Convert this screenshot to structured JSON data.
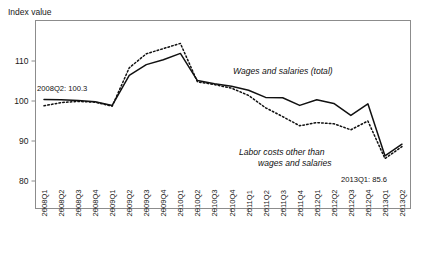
{
  "chart_data": {
    "type": "line",
    "title": "",
    "subtitle": "",
    "ylabel": "Index value",
    "xlabel": "",
    "ylim": [
      76,
      117
    ],
    "yticks": [
      80,
      90,
      100,
      110
    ],
    "ytick_labels": [
      "80",
      "90",
      "100",
      "110"
    ],
    "grid": false,
    "legend_position": "inline-annotations",
    "x": [
      "2008Q1",
      "2008Q2",
      "2008Q3",
      "2008Q4",
      "2009Q1",
      "2009Q2",
      "2009Q3",
      "2009Q4",
      "2010Q1",
      "2010Q2",
      "2010Q3",
      "2010Q4",
      "2011Q1",
      "2011Q2",
      "2011Q3",
      "2011Q4",
      "2012Q1",
      "2012Q2",
      "2012Q3",
      "2012Q4",
      "2013Q1",
      "2013Q2"
    ],
    "series": [
      {
        "name": "Wages and salaries (total)",
        "style": "solid",
        "values": [
          100.4,
          100.3,
          100.1,
          99.8,
          98.9,
          106.4,
          109.1,
          110.3,
          111.9,
          105.1,
          104.3,
          103.7,
          102.7,
          100.9,
          100.8,
          98.9,
          100.3,
          99.4,
          96.4,
          99.3,
          86.3,
          89.2
        ]
      },
      {
        "name": "Labor costs other than wages and salaries",
        "style": "dotted",
        "values": [
          98.8,
          99.6,
          99.9,
          99.7,
          98.7,
          108.3,
          111.8,
          113.1,
          114.4,
          104.8,
          104.1,
          103.2,
          101.4,
          98.3,
          96.1,
          93.8,
          94.6,
          94.3,
          92.8,
          95.0,
          85.6,
          88.6
        ]
      }
    ],
    "annotations": [
      {
        "name": "start-value-annotation",
        "text": "2008Q2: 100.3"
      },
      {
        "name": "end-value-annotation",
        "text": "2013Q1: 85.6"
      },
      {
        "name": "series-label-wages",
        "text": "Wages and salaries (total)"
      },
      {
        "name": "series-label-other-line1",
        "text": "Labor costs other than"
      },
      {
        "name": "series-label-other-line2",
        "text": "wages and salaries"
      }
    ],
    "colors": {
      "line": "#111111",
      "frame": "#8c8c8c",
      "background": "#ffffff",
      "text": "#1a1a1a"
    }
  }
}
